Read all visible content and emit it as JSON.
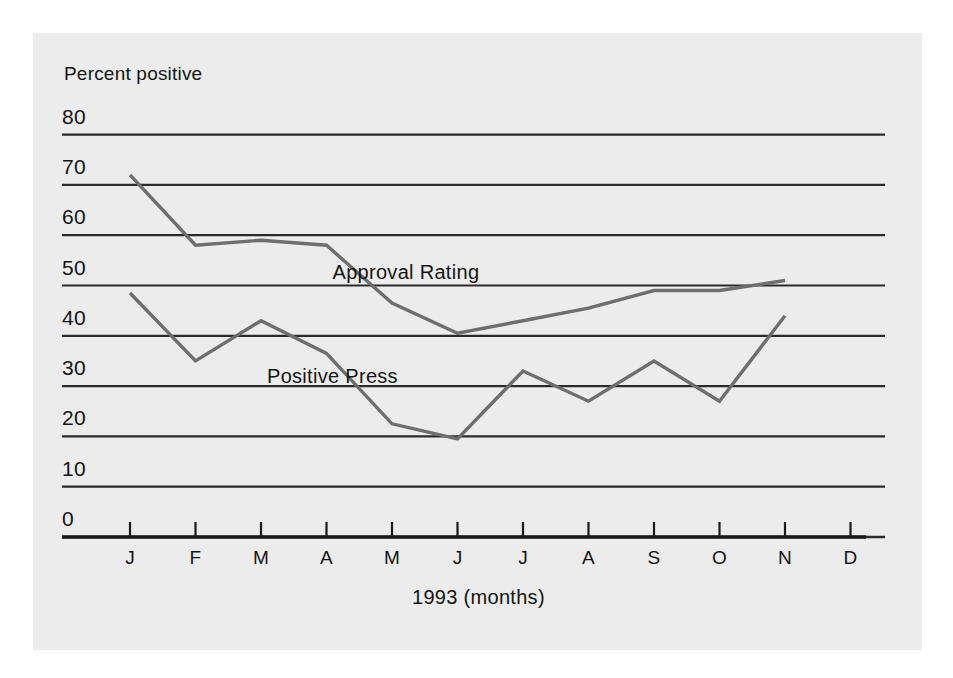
{
  "figure": {
    "background_color": "#ffffff",
    "panel_color": "#ececec",
    "axis_color": "#1a1a1a",
    "grid_color": "#2a2a2a",
    "series_color": "#6e6e6e",
    "text_color": "#141414"
  },
  "chart_data": {
    "type": "line",
    "title": "",
    "subtitle": "",
    "ylabel": "Percent positive",
    "xlabel": "1993 (months)",
    "ylim": [
      0,
      80
    ],
    "yticks": [
      0,
      10,
      20,
      30,
      40,
      50,
      60,
      70,
      80
    ],
    "ytick_labels": [
      "0",
      "10",
      "20",
      "30",
      "40",
      "50",
      "60",
      "70",
      "80"
    ],
    "grid": true,
    "grid_axis": "y",
    "legend_position": "inline-annotation",
    "categories": [
      "J",
      "F",
      "M",
      "A",
      "M",
      "J",
      "J",
      "A",
      "S",
      "O",
      "N",
      "D"
    ],
    "category_names": [
      "January",
      "February",
      "March",
      "April",
      "May",
      "June",
      "July",
      "August",
      "September",
      "October",
      "November",
      "December"
    ],
    "series": [
      {
        "name": "Approval Rating",
        "color": "#6e6e6e",
        "values": [
          72,
          58,
          59,
          58,
          46.5,
          40.5,
          43,
          45.5,
          49,
          49,
          51,
          null
        ]
      },
      {
        "name": "Positive Press",
        "color": "#6e6e6e",
        "values": [
          48.5,
          35,
          43,
          36.5,
          22.5,
          19.5,
          33,
          27,
          35,
          27,
          44,
          null
        ]
      }
    ],
    "annotations": [
      {
        "text": "Approval Rating",
        "x_category": "A",
        "y_value": 52
      },
      {
        "text": "Positive Press",
        "x_category": "M",
        "y_value": 31.5
      }
    ]
  }
}
